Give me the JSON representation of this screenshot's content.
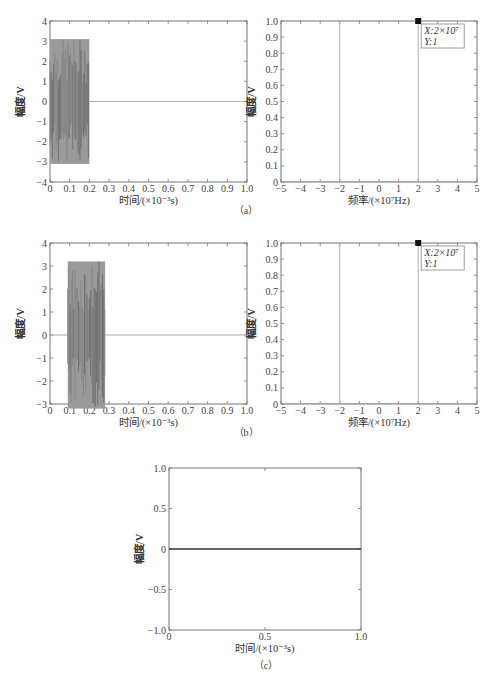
{
  "chart_data": [
    {
      "id": "a_time",
      "panel": "(a)",
      "type": "line",
      "title": "",
      "xlabel": "时间/(×10⁻³s)",
      "ylabel": "幅度/V",
      "xlim": [
        0,
        1.0
      ],
      "ylim": [
        -4,
        4
      ],
      "xticks": [
        "0",
        "0.1",
        "0.2",
        "0.3",
        "0.4",
        "0.5",
        "0.6",
        "0.7",
        "0.8",
        "0.9",
        "1.0"
      ],
      "yticks": [
        "-4",
        "-3",
        "-2",
        "-1",
        "0",
        "1",
        "2",
        "3",
        "4"
      ],
      "signal": {
        "description": "dense oscillating burst",
        "t_start": 0.0,
        "t_end": 0.2,
        "amplitude": 3.1,
        "after": 0
      },
      "grid": false
    },
    {
      "id": "a_freq",
      "panel": "(a)",
      "type": "line",
      "xlabel": "频率/(×10⁷Hz)",
      "ylabel": "幅度/V",
      "xlim": [
        -5,
        5
      ],
      "ylim": [
        0,
        1.0
      ],
      "xticks": [
        "-5",
        "-4",
        "-3",
        "-2",
        "-1",
        "0",
        "1",
        "2",
        "3",
        "4",
        "5"
      ],
      "yticks": [
        "0",
        "0.1",
        "0.2",
        "0.3",
        "0.4",
        "0.5",
        "0.6",
        "0.7",
        "0.8",
        "0.9",
        "1.0"
      ],
      "spikes": [
        {
          "x": -2,
          "y": 1
        },
        {
          "x": 2,
          "y": 1
        }
      ],
      "datatip": {
        "x": 2,
        "y": 1,
        "x_label": "X:2×10⁷",
        "y_label": "Y:1"
      }
    },
    {
      "id": "b_time",
      "panel": "(b)",
      "type": "line",
      "xlabel": "时间/(×10⁻³s)",
      "ylabel": "幅度/V",
      "xlim": [
        0,
        1.0
      ],
      "ylim": [
        -3,
        4
      ],
      "xticks": [
        "0",
        "0.1",
        "0.2",
        "0.3",
        "0.4",
        "0.5",
        "0.6",
        "0.7",
        "0.8",
        "0.9",
        "1.0"
      ],
      "yticks": [
        "-3",
        "-2",
        "-1",
        "0",
        "1",
        "2",
        "3",
        "4"
      ],
      "signal": {
        "description": "dense oscillating burst (delayed)",
        "t_start": 0.09,
        "t_end": 0.28,
        "amplitude": 3.2,
        "after": 0
      }
    },
    {
      "id": "b_freq",
      "panel": "(b)",
      "type": "line",
      "xlabel": "频率/(×10⁷Hz)",
      "ylabel": "幅度/V",
      "xlim": [
        -5,
        5
      ],
      "ylim": [
        0,
        1.0
      ],
      "xticks": [
        "-5",
        "-4",
        "-3",
        "-2",
        "-1",
        "0",
        "1",
        "2",
        "3",
        "4",
        "5"
      ],
      "yticks": [
        "0",
        "0.1",
        "0.2",
        "0.3",
        "0.4",
        "0.5",
        "0.6",
        "0.7",
        "0.8",
        "0.9",
        "1.0"
      ],
      "spikes": [
        {
          "x": -2,
          "y": 1
        },
        {
          "x": 2,
          "y": 1
        }
      ],
      "datatip": {
        "x": 2,
        "y": 1,
        "x_label": "X:2×10⁷",
        "y_label": "Y:1"
      }
    },
    {
      "id": "c_time",
      "panel": "(c)",
      "type": "line",
      "xlabel": "时间/(×10⁻³s)",
      "ylabel": "幅度/V",
      "xlim": [
        0,
        1.0
      ],
      "ylim": [
        -1.0,
        1.0
      ],
      "xticks": [
        "0",
        "0.5",
        "1.0"
      ],
      "yticks": [
        "-1.0",
        "-0.5",
        "0",
        "0.5",
        "1.0"
      ],
      "x": [
        0,
        1.0
      ],
      "y": [
        0,
        0
      ]
    }
  ],
  "captions": {
    "a": "（a）",
    "b": "（b）",
    "c": "（c）"
  }
}
